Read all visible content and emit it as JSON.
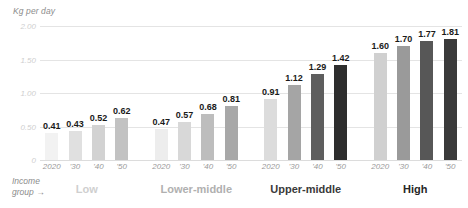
{
  "chart_data": {
    "type": "bar",
    "title": "",
    "subtitle": "",
    "xlabel": "Income group",
    "ylabel": "Kg per day",
    "ylim": [
      0,
      2.0
    ],
    "grid": true,
    "legend": "none",
    "y_ticks": [
      "0",
      "0.50",
      "1.00",
      "1.50",
      "2.00"
    ],
    "y_tick_values": [
      0,
      0.5,
      1.0,
      1.5,
      2.0
    ],
    "x_tick_labels": [
      "2020",
      "'30",
      "'40",
      "'50"
    ],
    "categories": [
      "Low",
      "Lower-middle",
      "Upper-middle",
      "High"
    ],
    "series": [
      {
        "name": "2020",
        "values": [
          0.41,
          0.47,
          0.91,
          1.6
        ]
      },
      {
        "name": "'30",
        "values": [
          0.43,
          0.57,
          1.12,
          1.7
        ]
      },
      {
        "name": "'40",
        "values": [
          0.52,
          0.68,
          1.29,
          1.77
        ]
      },
      {
        "name": "'50",
        "values": [
          0.62,
          0.81,
          1.42,
          1.81
        ]
      }
    ],
    "groups": [
      {
        "label": "Low",
        "label_color": "#cfcfcf",
        "bars": [
          {
            "year": "2020",
            "value": 0.41,
            "label": "0.41",
            "color": "#f2f2f2"
          },
          {
            "year": "'30",
            "value": 0.43,
            "label": "0.43",
            "color": "#e0e0e0"
          },
          {
            "year": "'40",
            "value": 0.52,
            "label": "0.52",
            "color": "#d2d2d2"
          },
          {
            "year": "'50",
            "value": 0.62,
            "label": "0.62",
            "color": "#c2c2c2"
          }
        ]
      },
      {
        "label": "Lower-middle",
        "label_color": "#b0b0b0",
        "bars": [
          {
            "year": "2020",
            "value": 0.47,
            "label": "0.47",
            "color": "#ededed"
          },
          {
            "year": "'30",
            "value": 0.57,
            "label": "0.57",
            "color": "#d8d8d8"
          },
          {
            "year": "'40",
            "value": 0.68,
            "label": "0.68",
            "color": "#bdbdbd"
          },
          {
            "year": "'50",
            "value": 0.81,
            "label": "0.81",
            "color": "#a8a8a8"
          }
        ]
      },
      {
        "label": "Upper-middle",
        "label_color": "#3a3a3a",
        "bars": [
          {
            "year": "2020",
            "value": 0.91,
            "label": "0.91",
            "color": "#dcdcdc"
          },
          {
            "year": "'30",
            "value": 1.12,
            "label": "1.12",
            "color": "#a5a5a5"
          },
          {
            "year": "'40",
            "value": 1.29,
            "label": "1.29",
            "color": "#5e5e5e"
          },
          {
            "year": "'50",
            "value": 1.42,
            "label": "1.42",
            "color": "#2e2e2e"
          }
        ]
      },
      {
        "label": "High",
        "label_color": "#262626",
        "bars": [
          {
            "year": "2020",
            "value": 1.6,
            "label": "1.60",
            "color": "#d0d0d0"
          },
          {
            "year": "'30",
            "value": 1.7,
            "label": "1.70",
            "color": "#9a9a9a"
          },
          {
            "year": "'40",
            "value": 1.77,
            "label": "1.77",
            "color": "#575757"
          },
          {
            "year": "'50",
            "value": 1.81,
            "label": "1.81",
            "color": "#3a3a3a"
          }
        ]
      }
    ]
  },
  "axis": {
    "y_title": "Kg per day"
  },
  "caption": {
    "income_line1": "Income",
    "income_line2": "group",
    "arrow": "→"
  }
}
